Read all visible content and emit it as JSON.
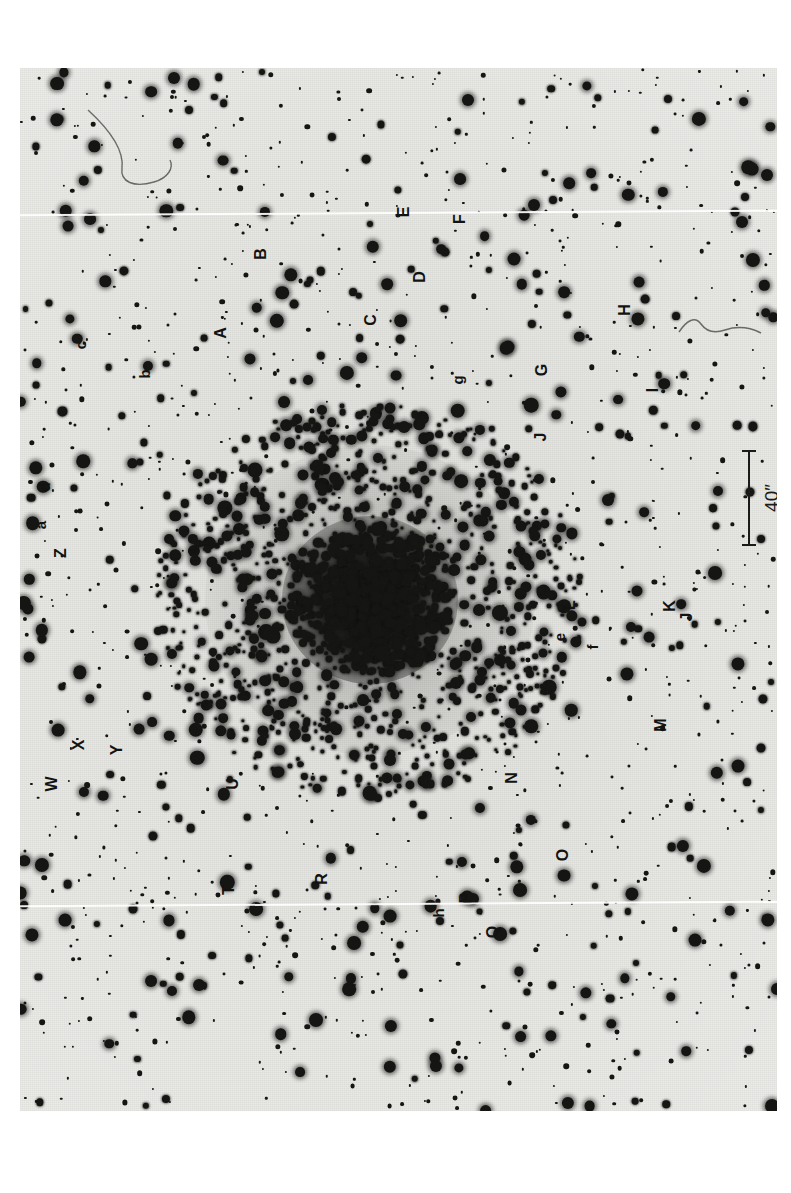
{
  "figure": {
    "kind": "photographic-plate-finder-chart",
    "orientation_note": "labels printed rotated 90 degrees",
    "background_color": "#e9e9e6",
    "star_color": "#151513",
    "plate": {
      "left": 20,
      "top": 68,
      "width": 757,
      "height": 1043
    }
  },
  "scale_bar": {
    "label": "40″",
    "value": 40,
    "unit": "arcsec",
    "orientation": "vertical",
    "bar": {
      "x": 729,
      "y_top": 450,
      "y_bottom": 546,
      "length_px": 96
    }
  },
  "labels": [
    {
      "text": "E",
      "x": 404,
      "y": 212,
      "case": "upper"
    },
    {
      "text": "F",
      "x": 460,
      "y": 219,
      "case": "upper"
    },
    {
      "text": "B",
      "x": 261,
      "y": 254,
      "case": "upper"
    },
    {
      "text": "D",
      "x": 420,
      "y": 277,
      "case": "upper"
    },
    {
      "text": "C",
      "x": 371,
      "y": 320,
      "case": "upper"
    },
    {
      "text": "A",
      "x": 221,
      "y": 333,
      "case": "upper"
    },
    {
      "text": "H",
      "x": 625,
      "y": 310,
      "case": "upper"
    },
    {
      "text": "c",
      "x": 80,
      "y": 345,
      "case": "lower"
    },
    {
      "text": "b",
      "x": 144,
      "y": 374,
      "case": "lower"
    },
    {
      "text": "g",
      "x": 457,
      "y": 380,
      "case": "lower"
    },
    {
      "text": "G",
      "x": 542,
      "y": 370,
      "case": "upper"
    },
    {
      "text": "I",
      "x": 653,
      "y": 390,
      "case": "upper"
    },
    {
      "text": "J",
      "x": 541,
      "y": 437,
      "case": "upper"
    },
    {
      "text": "d",
      "x": 44,
      "y": 487,
      "case": "lower"
    },
    {
      "text": "a",
      "x": 40,
      "y": 525,
      "case": "lower"
    },
    {
      "text": "Z",
      "x": 61,
      "y": 553,
      "case": "upper"
    },
    {
      "text": "L",
      "x": 570,
      "y": 605,
      "case": "upper"
    },
    {
      "text": "K",
      "x": 670,
      "y": 606,
      "case": "upper"
    },
    {
      "text": "J",
      "x": 687,
      "y": 617,
      "case": "upper"
    },
    {
      "text": "e",
      "x": 559,
      "y": 637,
      "case": "lower"
    },
    {
      "text": "f",
      "x": 592,
      "y": 647,
      "case": "lower"
    },
    {
      "text": "M",
      "x": 661,
      "y": 725,
      "case": "upper"
    },
    {
      "text": "X",
      "x": 79,
      "y": 745,
      "case": "upper"
    },
    {
      "text": "Y",
      "x": 117,
      "y": 750,
      "case": "upper"
    },
    {
      "text": "W",
      "x": 52,
      "y": 784,
      "case": "upper"
    },
    {
      "text": "U",
      "x": 233,
      "y": 784,
      "case": "upper"
    },
    {
      "text": "N",
      "x": 512,
      "y": 778,
      "case": "upper"
    },
    {
      "text": "O",
      "x": 563,
      "y": 855,
      "case": "upper"
    },
    {
      "text": "R",
      "x": 322,
      "y": 879,
      "case": "upper"
    },
    {
      "text": "T",
      "x": 229,
      "y": 890,
      "case": "upper"
    },
    {
      "text": "P",
      "x": 466,
      "y": 898,
      "case": "upper"
    },
    {
      "text": "h",
      "x": 438,
      "y": 913,
      "case": "lower"
    },
    {
      "text": "Q",
      "x": 493,
      "y": 932,
      "case": "upper"
    }
  ],
  "defects": {
    "seams": [
      {
        "y": 212,
        "note": "white horizontal scan seam, upper"
      },
      {
        "y": 903,
        "note": "white horizontal scan seam, lower"
      }
    ],
    "hairs": [
      {
        "x": 95,
        "y": 120,
        "note": "curved hair near top-left"
      },
      {
        "x": 700,
        "y": 320,
        "note": "squiggle beside bright star"
      }
    ]
  },
  "cluster": {
    "core_center": {
      "x": 370,
      "y": 600
    },
    "core_radius_px": 88,
    "halo_radius_px": 165
  }
}
